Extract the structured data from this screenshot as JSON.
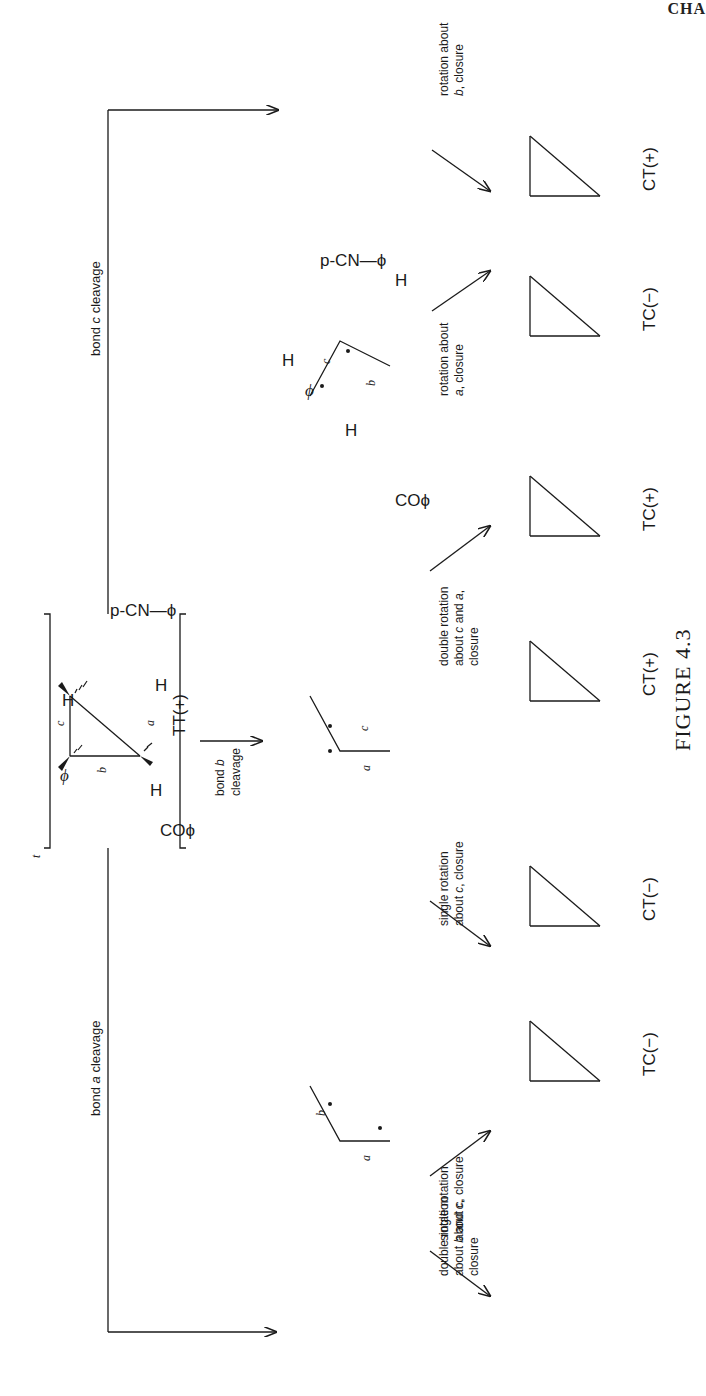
{
  "header": {
    "running_head_fragment": "CHA"
  },
  "figure": {
    "caption": "FIGURE 4.3",
    "starting_material": {
      "label": "TT(+)",
      "bracket_superscript": "t",
      "bond_labels": [
        "a",
        "b",
        "c"
      ]
    },
    "pathways": [
      {
        "id": "bond-c",
        "label": "bond c cleavage",
        "intermediate_bond_labels": [
          "a",
          "b"
        ],
        "steps": [
          {
            "arrow_label": "rotation about b, closure",
            "product": "CT(+)"
          },
          {
            "arrow_label": "rotation about a, closure",
            "product": "TC(−)"
          }
        ]
      },
      {
        "id": "bond-b",
        "label": "bond b cleavage",
        "intermediate_bond_labels": [
          "a",
          "c"
        ],
        "steps": [
          {
            "arrow_label": "double rotation about c and a, closure",
            "product": "TC(+)"
          },
          {
            "arrow_label": "single rotation about c, closure",
            "product": "CT(+)"
          }
        ]
      },
      {
        "id": "bond-a",
        "label": "bond a cleavage",
        "intermediate_bond_labels": [
          "b",
          "c"
        ],
        "steps": [
          {
            "arrow_label": "double rotation about b and c, closure",
            "product": "CT(−)"
          },
          {
            "arrow_label": "single rotation about c, closure",
            "product": "TC(−)"
          }
        ]
      }
    ],
    "substituents": {
      "aryl": "p-CN—ϕ",
      "acyl": "COϕ",
      "phenyl": "ϕ",
      "hydrogen": "H"
    }
  }
}
